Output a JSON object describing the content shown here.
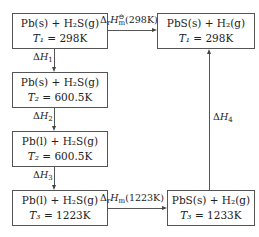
{
  "diagram": {
    "boxes": [
      {
        "id": "A",
        "reaction": "Pb(s) + H₂S(g)",
        "temp_var": "T₁",
        "temp": "= 298K"
      },
      {
        "id": "B",
        "reaction": "Pb(s) + H₂S(g)",
        "temp_var": "T₂",
        "temp": "= 600.5K"
      },
      {
        "id": "C",
        "reaction": "Pb(l) + H₂S(g)",
        "temp_var": "T₂",
        "temp": "= 600.5K"
      },
      {
        "id": "D",
        "reaction": "Pb(l) + H₂S(g)",
        "temp_var": "T₃",
        "temp": "= 1223K"
      },
      {
        "id": "E",
        "reaction": "PbS(s) + H₂(g)",
        "temp_var": "T₁",
        "temp": "= 298K"
      },
      {
        "id": "F",
        "reaction": "PbS(s) + H₂(g)",
        "temp_var": "T₃",
        "temp": "= 1233K"
      }
    ],
    "edges": [
      {
        "from": "A",
        "to": "E",
        "label": "ΔᵣHₘ°(298K)"
      },
      {
        "from": "A",
        "to": "B",
        "label": "ΔH₁"
      },
      {
        "from": "B",
        "to": "C",
        "label": "ΔH₂"
      },
      {
        "from": "C",
        "to": "D",
        "label": "ΔH₃"
      },
      {
        "from": "D",
        "to": "F",
        "label": "ΔᵣHₘ(1223K)"
      },
      {
        "from": "F",
        "to": "E",
        "label": "ΔH₄"
      }
    ]
  },
  "labels": {
    "delta": "Δ",
    "H": "H",
    "r": "r",
    "m": "m",
    "theta": "⊖",
    "t298": "(298K)",
    "t1223": "(1223K)",
    "h1": "1",
    "h2": "2",
    "h3": "3",
    "h4": "4"
  }
}
